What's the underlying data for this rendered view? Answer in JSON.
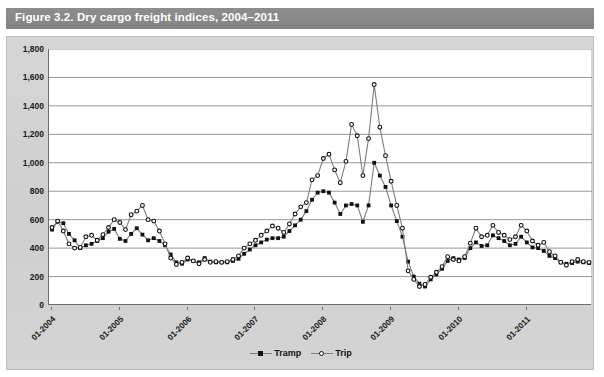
{
  "figure": {
    "title": "Figure 3.2.  Dry cargo freight indices, 2004–2011"
  },
  "legend": {
    "items": [
      {
        "label": "Tramp",
        "marker": "filled-square",
        "color": "#111111"
      },
      {
        "label": "Trip",
        "marker": "open-circle",
        "color": "#111111"
      }
    ]
  },
  "colors": {
    "title_bar": "#8a8a8a",
    "panel": "#d2d2d2",
    "plot_bg": "#ffffff",
    "gridline": "#8c8c8c",
    "axis": "#6e6e6e",
    "line": "#7d7d7d",
    "marker": "#111111"
  },
  "chart_data": {
    "type": "line",
    "title": "Dry cargo freight indices, 2004–2011",
    "xlabel": "",
    "ylabel": "",
    "ylim": [
      0,
      1800
    ],
    "yticks": [
      0,
      200,
      400,
      600,
      800,
      1000,
      1200,
      1400,
      1600,
      1800
    ],
    "ytick_labels": [
      "0",
      "200",
      "400",
      "600",
      "800",
      "1,000",
      "1,200",
      "1,400",
      "1,600",
      "1,800"
    ],
    "xtick_labels": [
      "01-2004",
      "01-2005",
      "01-2006",
      "01-2007",
      "01-2008",
      "01-2009",
      "01-2010",
      "01-2011"
    ],
    "xtick_indices": [
      0,
      12,
      24,
      36,
      48,
      60,
      72,
      84
    ],
    "grid": true,
    "legend_position": "bottom",
    "x": [
      "01-2004",
      "02-2004",
      "03-2004",
      "04-2004",
      "05-2004",
      "06-2004",
      "07-2004",
      "08-2004",
      "09-2004",
      "10-2004",
      "11-2004",
      "12-2004",
      "01-2005",
      "02-2005",
      "03-2005",
      "04-2005",
      "05-2005",
      "06-2005",
      "07-2005",
      "08-2005",
      "09-2005",
      "10-2005",
      "11-2005",
      "12-2005",
      "01-2006",
      "02-2006",
      "03-2006",
      "04-2006",
      "05-2006",
      "06-2006",
      "07-2006",
      "08-2006",
      "09-2006",
      "10-2006",
      "11-2006",
      "12-2006",
      "01-2007",
      "02-2007",
      "03-2007",
      "04-2007",
      "05-2007",
      "06-2007",
      "07-2007",
      "08-2007",
      "09-2007",
      "10-2007",
      "11-2007",
      "12-2007",
      "01-2008",
      "02-2008",
      "03-2008",
      "04-2008",
      "05-2008",
      "06-2008",
      "07-2008",
      "08-2008",
      "09-2008",
      "10-2008",
      "11-2008",
      "12-2008",
      "01-2009",
      "02-2009",
      "03-2009",
      "04-2009",
      "05-2009",
      "06-2009",
      "07-2009",
      "08-2009",
      "09-2009",
      "10-2009",
      "11-2009",
      "12-2009",
      "01-2010",
      "02-2010",
      "03-2010",
      "04-2010",
      "05-2010",
      "06-2010",
      "07-2010",
      "08-2010",
      "09-2010",
      "10-2010",
      "11-2010",
      "12-2010",
      "01-2011",
      "02-2011",
      "03-2011",
      "04-2011",
      "05-2011",
      "06-2011",
      "07-2011",
      "08-2011",
      "09-2011",
      "10-2011",
      "11-2011",
      "12-2011"
    ],
    "series": [
      {
        "name": "Tramp",
        "marker": "filled-square",
        "values": [
          530,
          585,
          575,
          500,
          455,
          400,
          420,
          430,
          450,
          470,
          515,
          535,
          465,
          450,
          500,
          540,
          495,
          455,
          470,
          450,
          420,
          355,
          300,
          290,
          320,
          310,
          300,
          330,
          305,
          300,
          300,
          300,
          310,
          325,
          360,
          390,
          420,
          440,
          460,
          470,
          470,
          480,
          520,
          560,
          600,
          660,
          740,
          790,
          800,
          790,
          720,
          640,
          700,
          710,
          700,
          585,
          700,
          1000,
          910,
          830,
          700,
          590,
          480,
          305,
          200,
          150,
          130,
          180,
          215,
          255,
          310,
          330,
          320,
          330,
          400,
          440,
          415,
          420,
          490,
          470,
          450,
          420,
          430,
          480,
          440,
          405,
          400,
          380,
          345,
          330,
          300,
          290,
          295,
          305,
          300,
          295
        ]
      },
      {
        "name": "Trip",
        "marker": "open-circle",
        "values": [
          545,
          590,
          520,
          430,
          400,
          405,
          480,
          490,
          455,
          495,
          545,
          600,
          580,
          530,
          635,
          660,
          700,
          600,
          590,
          520,
          430,
          330,
          285,
          300,
          330,
          310,
          290,
          320,
          300,
          305,
          300,
          305,
          320,
          345,
          400,
          430,
          455,
          490,
          520,
          555,
          540,
          510,
          570,
          640,
          690,
          720,
          880,
          910,
          1030,
          1060,
          950,
          860,
          1010,
          1270,
          1190,
          910,
          1170,
          1550,
          1250,
          1050,
          870,
          700,
          540,
          240,
          180,
          130,
          145,
          195,
          230,
          270,
          340,
          320,
          310,
          340,
          435,
          540,
          480,
          490,
          560,
          510,
          490,
          460,
          480,
          560,
          520,
          450,
          420,
          440,
          375,
          345,
          300,
          280,
          305,
          320,
          305,
          300
        ]
      }
    ]
  }
}
